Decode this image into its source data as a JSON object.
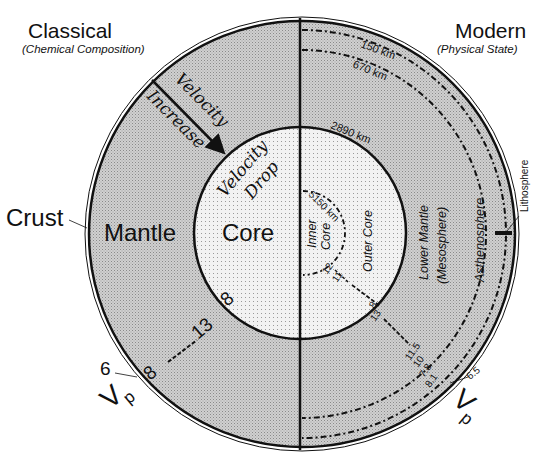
{
  "title_left": {
    "heading": "Classical",
    "subheading": "(Chemical Composition)"
  },
  "title_right": {
    "heading": "Modern",
    "subheading": "(Physical State)"
  },
  "classical_layers": {
    "crust": "Crust",
    "mantle": "Mantle",
    "core": "Core"
  },
  "annotations": {
    "velocity_increase_1": "Velocity",
    "velocity_increase_2": "Increase",
    "velocity_drop_1": "Velocity",
    "velocity_drop_2": "Drop"
  },
  "modern_layers": {
    "lithosphere": "Lithosphere",
    "asthenosphere": "Asthenosphere",
    "lower_mantle_1": "Lower Mantle",
    "lower_mantle_2": "(Mesosphere)",
    "outer_core": "Outer Core",
    "inner_core_1": "Inner",
    "inner_core_2": "Core"
  },
  "depths": {
    "d150": "150 km",
    "d670": "670 km",
    "d2890": "2890 km",
    "d5150": "5150 km"
  },
  "vp_left": {
    "label": "V",
    "subscript": "p",
    "crust": "6",
    "mantle_top": "8",
    "mantle_bottom": "13",
    "core_top": "8"
  },
  "vp_right": {
    "label": "V",
    "subscript": "p",
    "crust": "6.5",
    "lithosphere": "8.1",
    "asthenosphere_top": "7.8",
    "asthenosphere_bottom": "10",
    "lower_mantle_top": "11.5",
    "lower_mantle_bottom": "13",
    "outer_core_top": "8",
    "outer_core_bottom": "11",
    "inner_core": "12"
  },
  "colors": {
    "mantle_fill": "#c9c9c9",
    "core_fill": "#ececec",
    "line": "#111111",
    "background": "#ffffff"
  }
}
